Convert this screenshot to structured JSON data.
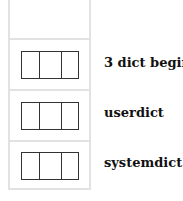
{
  "diagram": {
    "title": "",
    "stack": {
      "empty_top_slot": true,
      "entries": [
        {
          "label": "3 dict begin",
          "cells": 3
        },
        {
          "label": "userdict",
          "cells": 3
        },
        {
          "label": "systemdict",
          "cells": 3
        }
      ]
    }
  }
}
